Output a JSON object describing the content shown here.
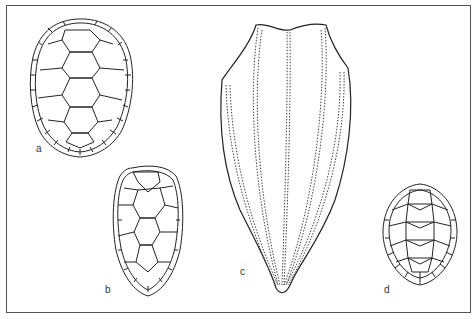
{
  "figure": {
    "panels": [
      {
        "label": "a",
        "shape": "oval carapace with scute pattern"
      },
      {
        "label": "b",
        "shape": "ovate carapace with serrated rear margin"
      },
      {
        "label": "c",
        "shape": "elongated leathery carapace with dotted longitudinal ridges"
      },
      {
        "label": "d",
        "shape": "rounded carapace with scute pattern"
      }
    ]
  },
  "colors": {
    "line": "#222222",
    "frame": "#555555",
    "background": "#ffffff"
  }
}
